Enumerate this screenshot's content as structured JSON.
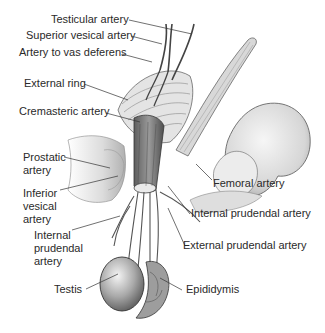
{
  "figure": {
    "labels_left": [
      {
        "id": "testicular",
        "text": "Testicular artery"
      },
      {
        "id": "sup-vesical",
        "text": "Superior vesical artery"
      },
      {
        "id": "vas",
        "text": "Artery to vas deferens"
      },
      {
        "id": "ext-ring",
        "text": "External ring"
      },
      {
        "id": "cremasteric",
        "text": "Cremasteric artery"
      },
      {
        "id": "prostatic",
        "text": "Prostatic\nartery"
      },
      {
        "id": "inf-vesical",
        "text": "Inferior\nvesical\nartery"
      },
      {
        "id": "int-pud-left",
        "text": "Internal\nprudendal\nartery"
      },
      {
        "id": "testis",
        "text": "Testis"
      }
    ],
    "labels_right": [
      {
        "id": "femoral",
        "text": "Femoral artery"
      },
      {
        "id": "int-pud-right",
        "text": "Internal prudendal artery"
      },
      {
        "id": "ext-pud",
        "text": "External prudendal artery"
      },
      {
        "id": "epididymis",
        "text": "Epididymis"
      }
    ]
  },
  "colors": {
    "background": "#ffffff",
    "label": "#2a2a2a",
    "leader": "#333333",
    "tissue_light": "#e6e6e6",
    "tissue_mid": "#b8b8b8",
    "tissue_dark": "#7a7a7a",
    "outline": "#3a3a3a"
  }
}
